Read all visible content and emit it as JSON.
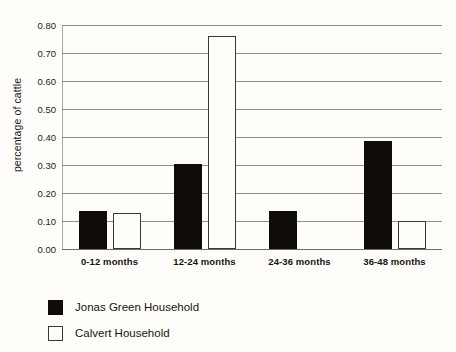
{
  "chart_data": {
    "type": "bar",
    "title": "",
    "subtitle": "",
    "xlabel": "",
    "ylabel": "percentage of cattle",
    "ylim": [
      0.0,
      0.8
    ],
    "y_ticks": [
      "0.00",
      "0.10",
      "0.20",
      "0.30",
      "0.40",
      "0.50",
      "0.60",
      "0.70",
      "0.80"
    ],
    "y_tick_values": [
      0.0,
      0.1,
      0.2,
      0.3,
      0.4,
      0.5,
      0.6,
      0.7,
      0.8
    ],
    "grid": true,
    "grid_axis": "y",
    "legend_position": "below-left",
    "categories": [
      "0-12 months",
      "12-24 months",
      "24-36 months",
      "36-48 months"
    ],
    "series": [
      {
        "name": "Jonas Green Household",
        "color": "#100d08",
        "style": "filled",
        "values": [
          0.135,
          0.305,
          0.135,
          0.385
        ]
      },
      {
        "name": "Calvert Household",
        "color": "#fefdfa",
        "edge_color": "#3b3b36",
        "style": "outlined",
        "values": [
          0.13,
          0.76,
          0.0,
          0.1
        ]
      }
    ]
  },
  "colors": {
    "background": "#fefdfa",
    "gridline": "#8f8f88",
    "axis": "#6e6e68",
    "text": "#15150f",
    "series_dark": "#100d08",
    "series_light_fill": "#fefdfa",
    "series_light_edge": "#3b3b36"
  }
}
